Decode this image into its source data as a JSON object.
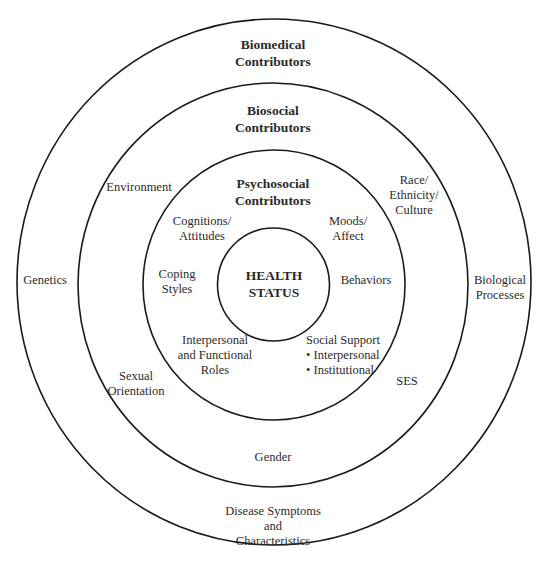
{
  "diagram": {
    "rings": [
      {
        "name": "biomedical",
        "title_lines": [
          "Biomedical",
          "Contributors"
        ],
        "cx": 274,
        "cy": 282,
        "rx": 257,
        "ry": 263
      },
      {
        "name": "biosocial",
        "title_lines": [
          "Biosocial",
          "Contributors"
        ],
        "cx": 273,
        "cy": 285,
        "rx": 195,
        "ry": 202
      },
      {
        "name": "psychosocial",
        "title_lines": [
          "Psychosocial",
          "Contributors"
        ],
        "cx": 274,
        "cy": 285,
        "rx": 131,
        "ry": 135
      },
      {
        "name": "health-status",
        "title_lines": [
          "HEALTH",
          "STATUS"
        ],
        "cx": 273.5,
        "cy": 284.5,
        "rx": 56,
        "ry": 56.5
      }
    ],
    "biomedical_items": {
      "genetics": "Genetics",
      "biological_processes": [
        "Biological",
        "Processes"
      ],
      "disease_symptoms": [
        "Disease Symptoms",
        "and",
        "Characteristics"
      ]
    },
    "biosocial_items": {
      "environment": "Environment",
      "race": [
        "Race/",
        "Ethnicity/",
        "Culture"
      ],
      "sexual_orientation": [
        "Sexual",
        "Orientation"
      ],
      "ses": "SES",
      "gender": "Gender"
    },
    "psychosocial_items": {
      "cognitions": [
        "Cognitions/",
        "Attitudes"
      ],
      "moods": [
        "Moods/",
        "Affect"
      ],
      "coping": [
        "Coping",
        "Styles"
      ],
      "behaviors": "Behaviors",
      "interpersonal_roles": [
        "Interpersonal",
        "and Functional",
        "Roles"
      ],
      "social_support": [
        "Social Support",
        "• Interpersonal",
        "• Institutional"
      ]
    },
    "line_color": "#1a1a1a"
  }
}
